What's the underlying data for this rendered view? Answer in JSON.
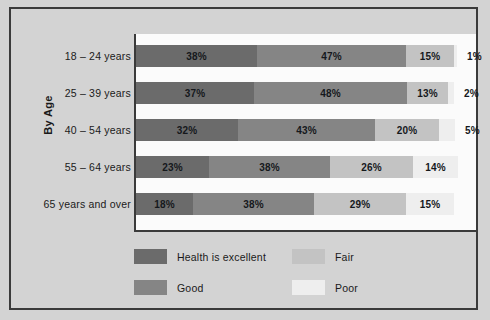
{
  "chart_data": {
    "type": "bar",
    "subtype": "stacked-horizontal-100",
    "title": "",
    "xlabel": "",
    "ylabel": "By Age",
    "grid": false,
    "legend_position": "bottom",
    "xlim": [
      0,
      101
    ],
    "categories": [
      "18 – 24 years",
      "25 – 39 years",
      "40 – 54 years",
      "55 – 64 years",
      "65 years and over"
    ],
    "series": [
      {
        "name": "Health is excellent",
        "color": "#6b6b6b",
        "values": [
          38,
          37,
          32,
          23,
          18
        ]
      },
      {
        "name": "Good",
        "color": "#858585",
        "values": [
          47,
          48,
          43,
          38,
          38
        ]
      },
      {
        "name": "Fair",
        "color": "#c3c3c3",
        "values": [
          15,
          13,
          20,
          26,
          29
        ]
      },
      {
        "name": "Poor",
        "color": "#eeeeee",
        "values": [
          1,
          2,
          5,
          14,
          15
        ]
      }
    ],
    "value_labels": [
      [
        "38%",
        "47%",
        "15%",
        "1%"
      ],
      [
        "37%",
        "48%",
        "13%",
        "2%"
      ],
      [
        "32%",
        "43%",
        "20%",
        "5%"
      ],
      [
        "23%",
        "38%",
        "26%",
        "14%"
      ],
      [
        "18%",
        "38%",
        "29%",
        "15%"
      ]
    ],
    "labels_outside_bar": [
      true,
      true,
      true,
      false,
      false
    ]
  },
  "axis": {
    "vertical_title": "By Age"
  },
  "legend": {
    "entries": [
      {
        "label": "Health is excellent",
        "color": "#6b6b6b"
      },
      {
        "label": "Fair",
        "color": "#c3c3c3"
      },
      {
        "label": "Good",
        "color": "#858585"
      },
      {
        "label": "Poor",
        "color": "#eeeeee"
      }
    ]
  },
  "colors": {
    "page_background": "#d3d3d3",
    "plot_background": "#fbfbfb",
    "frame_border": "#3a3a3a",
    "text": "#1a1a1a"
  }
}
